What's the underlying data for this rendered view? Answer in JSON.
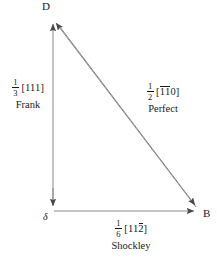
{
  "figure": {
    "kind": "dislocation-reaction-triangle",
    "stroke_color": "#8a8a8a",
    "text_color": "#1a1a1a",
    "background": "#ffffff"
  },
  "vertices": [
    {
      "id": "d",
      "label": "D",
      "x": 53,
      "y": 18
    },
    {
      "id": "delta",
      "label": "δ",
      "x": 53,
      "y": 211
    },
    {
      "id": "b",
      "label": "B",
      "x": 200,
      "y": 211
    }
  ],
  "edges": [
    {
      "id": "frank",
      "from": "delta",
      "to": "d",
      "arrow": "to",
      "fraction": {
        "numerator": "1",
        "denominator": "3"
      },
      "indices_open": "[",
      "indices": "111",
      "indices_close": "]",
      "overbars": [
        false,
        false,
        false
      ],
      "type_name": "Frank"
    },
    {
      "id": "perfect",
      "from": "d",
      "to": "b",
      "arrow": "both",
      "fraction": {
        "numerator": "1",
        "denominator": "2"
      },
      "indices_open": "[",
      "indices": "110",
      "indices_close": "]",
      "overbars": [
        true,
        true,
        false
      ],
      "type_name": "Perfect"
    },
    {
      "id": "shockley",
      "from": "delta",
      "to": "b",
      "arrow": "to",
      "fraction": {
        "numerator": "1",
        "denominator": "6"
      },
      "indices_open": "[",
      "indices": "112",
      "indices_close": "]",
      "overbars": [
        false,
        false,
        true
      ],
      "type_name": "Shockley"
    }
  ],
  "labels": {
    "vertex_d": "D",
    "vertex_b": "B",
    "vertex_delta": "δ",
    "frank_num": "1",
    "frank_den": "3",
    "frank_open": "[",
    "frank_i1": "1",
    "frank_i2": "1",
    "frank_i3": "1",
    "frank_close": "]",
    "frank_name": "Frank",
    "perfect_num": "1",
    "perfect_den": "2",
    "perfect_open": "[",
    "perfect_i1": "1",
    "perfect_i2": "1",
    "perfect_i3": "0",
    "perfect_close": "]",
    "perfect_name": "Perfect",
    "shockley_num": "1",
    "shockley_den": "6",
    "shockley_open": "[",
    "shockley_i1": "1",
    "shockley_i2": "1",
    "shockley_i3": "2",
    "shockley_close": "]",
    "shockley_name": "Shockley"
  }
}
